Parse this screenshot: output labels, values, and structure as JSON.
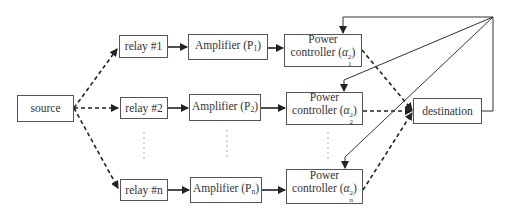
{
  "diagram": {
    "source": {
      "label": "source"
    },
    "destination": {
      "label": "destination"
    },
    "relays": [
      {
        "label": "relay #1",
        "amplifier": "Amplifier (P",
        "amp_sub": "1",
        "pc_line1": "Power",
        "pc_line2": "controller (",
        "pc_sup": "2",
        "pc_sub": "1"
      },
      {
        "label": "relay #2",
        "amplifier": "Amplifier (P",
        "amp_sub": "2",
        "pc_line1": "Power",
        "pc_line2": "controller (",
        "pc_sup": "2",
        "pc_sub": "2"
      },
      {
        "label": "relay #n",
        "amplifier": "Amplifier (P",
        "amp_sub": "n",
        "pc_line1": "Power",
        "pc_line2": "controller (",
        "pc_sup": "2",
        "pc_sub": "n"
      }
    ],
    "symbols": {
      "alpha": "α",
      "close_paren": ")"
    },
    "colors": {
      "line": "#222222",
      "box_border": "#555555",
      "text": "#333333"
    }
  }
}
